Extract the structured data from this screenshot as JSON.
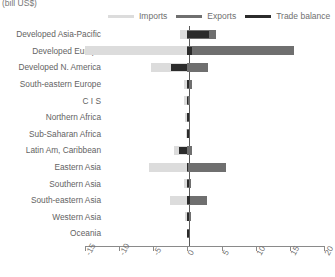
{
  "unit_label": "(bill US$)",
  "legend": {
    "items": [
      {
        "label": "Imports",
        "color": "#dcdcdc",
        "key": "imports"
      },
      {
        "label": "Exports",
        "color": "#6f6f6f",
        "key": "exports"
      },
      {
        "label": "Trade balance",
        "color": "#2b2b2b",
        "key": "balance"
      }
    ]
  },
  "axis": {
    "ticks": [
      -15,
      -10,
      -5,
      0,
      5,
      10,
      15,
      20
    ],
    "tick_labels": [
      "-15",
      "-10",
      "-5",
      "0",
      "5",
      "10",
      "15",
      "20"
    ],
    "min": -15,
    "max": 20
  },
  "chart_data": {
    "type": "bar",
    "orientation": "horizontal",
    "title": "",
    "subtitle": "",
    "xlabel": "(bill US$)",
    "ylabel": "",
    "xlim": [
      -15,
      20
    ],
    "grid": false,
    "legend_position": "top",
    "categories": [
      "Developed Asia-Pacific",
      "Developed Europe",
      "Developed N. America",
      "South-eastern Europe",
      "C I S",
      "Northern Africa",
      "Sub-Saharan Africa",
      "Latin Am, Caribbean",
      "Eastern Asia",
      "Southern Asia",
      "South-eastern Asia",
      "Western Asia",
      "Oceania"
    ],
    "series": [
      {
        "name": "Imports",
        "color": "#dcdcdc",
        "values": [
          -1.1,
          -15.0,
          -5.4,
          -0.5,
          -0.5,
          -0.3,
          -0.2,
          -1.9,
          -5.7,
          -0.5,
          -2.5,
          -0.4,
          -0.1
        ]
      },
      {
        "name": "Exports",
        "color": "#6f6f6f",
        "values": [
          4.2,
          15.6,
          3.0,
          0.6,
          0.4,
          0.3,
          0.2,
          0.6,
          5.6,
          0.5,
          2.9,
          0.5,
          0.1
        ]
      },
      {
        "name": "Trade balance",
        "color": "#2b2b2b",
        "values": [
          3.1,
          0.6,
          -2.4,
          0.1,
          -0.1,
          0.0,
          0.0,
          -1.3,
          -0.1,
          0.0,
          0.4,
          0.1,
          0.0
        ]
      }
    ]
  }
}
